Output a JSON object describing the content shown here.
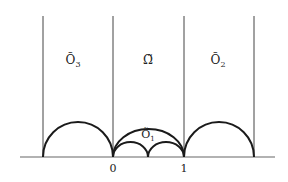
{
  "diagram": {
    "regions": {
      "left": {
        "label": "Õ",
        "sub": "3"
      },
      "center": {
        "label": "Ω̃"
      },
      "right": {
        "label": "Õ",
        "sub": "2"
      },
      "bottom": {
        "label": "Õ",
        "sub": "1"
      }
    },
    "axis_ticks": [
      "0",
      "1"
    ],
    "colors": {
      "stroke": "#1a1a1a",
      "axis": "#555555"
    }
  }
}
